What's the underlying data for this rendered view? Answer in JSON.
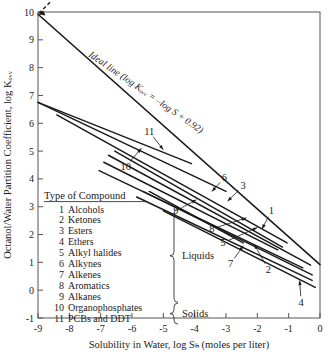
{
  "chart_data": {
    "type": "line",
    "title": "",
    "xlabel": "Solubility in Water, log Sₕ (moles per liter)",
    "ylabel": "Octanol/Water Partition Coefficient, log Kₒᵥᵥ",
    "xlim": [
      -9,
      0
    ],
    "ylim": [
      -1,
      10
    ],
    "xticks": [
      -9,
      -8,
      -7,
      -6,
      -5,
      -4,
      -3,
      -2,
      -1,
      0
    ],
    "yticks": [
      -1,
      0,
      1,
      2,
      3,
      4,
      5,
      6,
      7,
      8,
      9,
      10
    ],
    "grid": false,
    "legend_position": "inside-lower-left",
    "annotations": [
      {
        "id": "ideal",
        "text": "Ideal line (log Kₒᵥᵥ = –log S + 0.92)"
      }
    ],
    "series": [
      {
        "name": "Ideal line",
        "label": "ideal",
        "style": "solid-with-dashed-arrow",
        "x": [
          -9.0,
          0.0
        ],
        "y": [
          9.92,
          0.92
        ]
      },
      {
        "name": "PCBs and DDT",
        "label": "11",
        "x": [
          -9.0,
          -4.1
        ],
        "y": [
          6.75,
          4.55
        ]
      },
      {
        "name": "Organophosphates",
        "label": "10",
        "x": [
          -9.0,
          -3.0
        ],
        "y": [
          6.75,
          3.55
        ]
      },
      {
        "name": "Alkanes",
        "label": "9",
        "x": [
          -8.4,
          -1.05
        ],
        "y": [
          6.3,
          1.7
        ]
      },
      {
        "name": "Alkynes",
        "label": "6",
        "x": [
          -6.55,
          -1.2
        ],
        "y": [
          5.0,
          1.55
        ]
      },
      {
        "name": "Esters",
        "label": "3",
        "x": [
          -6.75,
          -0.3
        ],
        "y": [
          4.85,
          0.9
        ]
      },
      {
        "name": "Aromatics",
        "label": "8",
        "x": [
          -6.9,
          -1.35
        ],
        "y": [
          4.6,
          1.45
        ]
      },
      {
        "name": "Alkyl halides",
        "label": "5",
        "x": [
          -7.05,
          -0.55
        ],
        "y": [
          4.3,
          0.8
        ]
      },
      {
        "name": "Alkenes",
        "label": "7",
        "x": [
          -5.45,
          -2.45
        ],
        "y": [
          3.55,
          1.7
        ]
      },
      {
        "name": "Alcohols",
        "label": "1",
        "x": [
          -5.65,
          -0.25
        ],
        "y": [
          3.55,
          0.55
        ]
      },
      {
        "name": "Ketones",
        "label": "2",
        "x": [
          -5.85,
          -0.25
        ],
        "y": [
          3.35,
          0.35
        ]
      },
      {
        "name": "Ethers",
        "label": "4",
        "x": [
          -5.0,
          -0.15
        ],
        "y": [
          2.85,
          0.1
        ]
      }
    ],
    "callouts": [
      {
        "label": "11",
        "tx": -5.45,
        "ty": 5.7,
        "px": -5.0,
        "py": 5.05
      },
      {
        "label": "10",
        "tx": -6.2,
        "ty": 4.45,
        "px": -5.7,
        "py": 5.1
      },
      {
        "label": "9",
        "tx": -4.6,
        "ty": 2.85,
        "px": -3.95,
        "py": 3.25
      },
      {
        "label": "6",
        "tx": -3.05,
        "ty": 4.05,
        "px": -3.45,
        "py": 3.55
      },
      {
        "label": "3",
        "tx": -2.45,
        "ty": 3.75,
        "px": -2.95,
        "py": 3.2
      },
      {
        "label": "8",
        "tx": -3.45,
        "ty": 2.2,
        "px": -2.35,
        "py": 2.6
      },
      {
        "label": "5",
        "tx": -3.1,
        "ty": 1.7,
        "px": -2.0,
        "py": 2.25
      },
      {
        "label": "7",
        "tx": -2.85,
        "ty": 0.95,
        "px": -2.45,
        "py": 1.6
      },
      {
        "label": "1",
        "tx": -1.55,
        "ty": 2.85,
        "px": -1.85,
        "py": 2.2
      },
      {
        "label": "2",
        "tx": -1.65,
        "ty": 0.75,
        "px": -2.1,
        "py": 1.65
      },
      {
        "label": "4",
        "tx": -0.6,
        "ty": -0.45,
        "px": -0.65,
        "py": 0.35
      }
    ]
  },
  "legend": {
    "title": "Type of Compound",
    "items": [
      {
        "num": "1",
        "name": "Alcohols"
      },
      {
        "num": "2",
        "name": "Ketones"
      },
      {
        "num": "3",
        "name": "Esters"
      },
      {
        "num": "4",
        "name": "Ethers"
      },
      {
        "num": "5",
        "name": "Alkyl halides"
      },
      {
        "num": "6",
        "name": "Alkynes"
      },
      {
        "num": "7",
        "name": "Alkenes"
      },
      {
        "num": "8",
        "name": "Aromatics"
      },
      {
        "num": "9",
        "name": "Alkanes"
      },
      {
        "num": "10",
        "name": "Organophosphates"
      },
      {
        "num": "11",
        "name": "PCBs and DDT"
      }
    ],
    "group_liquids": "Liquids",
    "group_solids": "Solids"
  },
  "colors": {
    "ink": "#1a1a1a",
    "axis": "#555555"
  }
}
